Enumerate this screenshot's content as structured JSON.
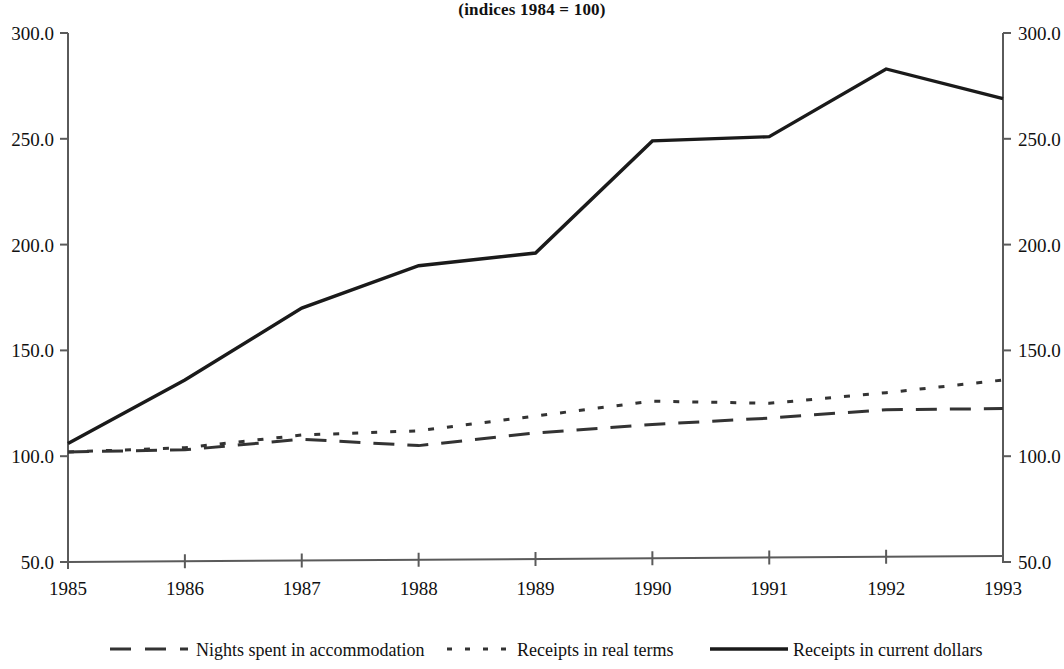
{
  "chart_data": {
    "type": "line",
    "title": "(indices 1984 = 100)",
    "xlabel": "",
    "ylabel": "",
    "x": [
      1985,
      1986,
      1987,
      1988,
      1989,
      1990,
      1991,
      1992,
      1993
    ],
    "xtick_labels": [
      "1985",
      "1986",
      "1987",
      "1988",
      "1989",
      "1990",
      "1991",
      "1992",
      "1993"
    ],
    "ylim": [
      50.0,
      300.0
    ],
    "ytick_labels": [
      "300.0",
      "250.0",
      "200.0",
      "150.0",
      "100.0",
      "50.0"
    ],
    "ytick_values": [
      300.0,
      250.0,
      200.0,
      150.0,
      100.0,
      50.0
    ],
    "right_axis": true,
    "right_ylim": [
      50.0,
      300.0
    ],
    "right_ytick_labels": [
      "300.0",
      "250.0",
      "200.0",
      "150.0",
      "100.0",
      "50.0"
    ],
    "grid": false,
    "legend_position": "bottom",
    "series": [
      {
        "name": "Nights spent in accommodation",
        "style": "dashed",
        "color": "#333333",
        "values": [
          102,
          103,
          108,
          105,
          111,
          115,
          118,
          122,
          122.5
        ]
      },
      {
        "name": "Receipts in real terms",
        "style": "dotted",
        "color": "#333333",
        "values": [
          102,
          104,
          110,
          112,
          119,
          126,
          125,
          130,
          136
        ]
      },
      {
        "name": "Receipts in current dollars",
        "style": "solid",
        "color": "#1a1a1a",
        "values": [
          106,
          136,
          170,
          190,
          196,
          249,
          251,
          283,
          269
        ]
      }
    ]
  },
  "legend": {
    "items": [
      {
        "label": "Nights spent in accommodation",
        "style": "dashed"
      },
      {
        "label": "Receipts in real terms",
        "style": "dotted"
      },
      {
        "label": "Receipts in current dollars",
        "style": "solid"
      }
    ]
  }
}
